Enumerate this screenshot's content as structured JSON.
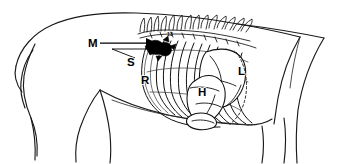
{
  "figure": {
    "background_color": "#ffffff",
    "line_color": "#111111",
    "view": "lateral",
    "width": 340,
    "height": 164
  },
  "labels": {
    "m": {
      "text": "M",
      "name": "mediastinum",
      "x": 88,
      "y": 47
    },
    "s": {
      "text": "S",
      "name": "sternum-shoulder",
      "x": 127,
      "y": 66
    },
    "r": {
      "text": "R",
      "name": "ribs",
      "x": 141,
      "y": 84
    },
    "h": {
      "text": "H",
      "name": "heart",
      "x": 198,
      "y": 96
    },
    "l": {
      "text": "L",
      "name": "lung",
      "x": 238,
      "y": 75
    }
  },
  "annotations": {
    "vertebra_number": "13"
  }
}
